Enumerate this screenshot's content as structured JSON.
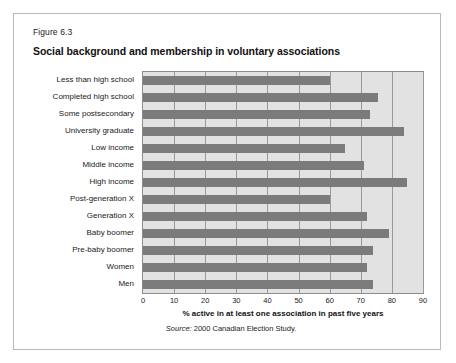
{
  "figure": {
    "number": "Figure 6.3",
    "title": "Social background and membership in voluntary associations",
    "source_prefix": "Source:",
    "source_text": " 2000 Canadian Election Study."
  },
  "chart_data": {
    "type": "bar",
    "orientation": "horizontal",
    "title": "Social background and membership in voluntary associations",
    "xlabel": "% active in at least one association in past five years",
    "ylabel": "",
    "xlim": [
      0,
      90
    ],
    "xticks": [
      0,
      10,
      20,
      30,
      40,
      50,
      60,
      70,
      80,
      90
    ],
    "xtick_labels": [
      "0",
      "10",
      "20",
      "30",
      "40",
      "50",
      "60",
      "70",
      "80",
      "90"
    ],
    "grid": true,
    "legend": "none",
    "categories": [
      "Less than high school",
      "Completed high school",
      "Some postsecondary",
      "University graduate",
      "Low income",
      "Middle income",
      "High income",
      "Post-generation X",
      "Generation X",
      "Baby boomer",
      "Pre-baby boomer",
      "Women",
      "Men"
    ],
    "values": [
      60,
      75.5,
      73,
      84,
      65,
      71,
      85,
      60,
      72,
      79,
      74,
      72,
      74
    ],
    "bar_color": "#7b7b7b",
    "plot_background": "#e2e2e2",
    "gridline_color": "#9a9a9a"
  }
}
